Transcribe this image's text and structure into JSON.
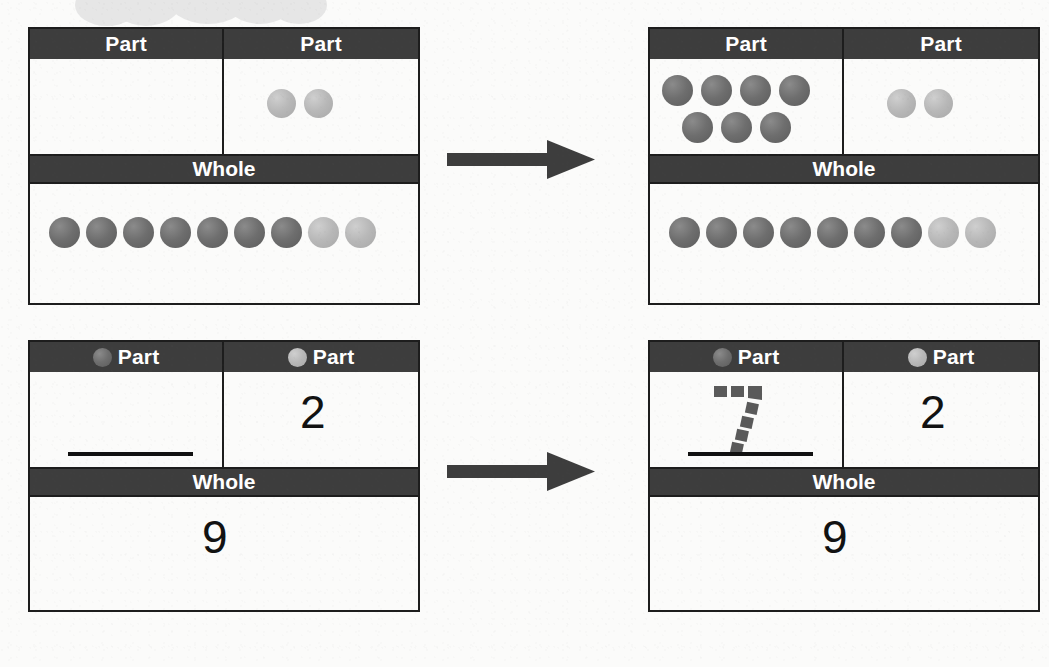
{
  "page": {
    "background_color": "#fbfbfa",
    "header_bar_color": "#3d3d3d",
    "border_color": "#1d1d1d",
    "dark_counter_color": "#6e6e6e",
    "light_counter_color": "#b8b8b8"
  },
  "labels": {
    "part": "Part",
    "whole": "Whole"
  },
  "decor": {
    "top_cloud": "cloud-shape",
    "arrow_top": "right-arrow-icon",
    "arrow_bottom": "right-arrow-icon"
  },
  "tables": [
    {
      "id": "top-left",
      "position": "top-left",
      "header_left": {
        "label": "Part",
        "dot": null
      },
      "header_right": {
        "label": "Part",
        "dot": null
      },
      "header_whole": "Whole",
      "part_left": {
        "type": "counters",
        "dark_count": 0,
        "light_count": 0,
        "rows": []
      },
      "part_right": {
        "type": "counters",
        "dark_count": 0,
        "light_count": 2,
        "rows": [
          [
            "light",
            "light"
          ]
        ]
      },
      "whole": {
        "type": "counters",
        "dark_count": 7,
        "light_count": 2,
        "total": 9,
        "rows": [
          [
            "dark",
            "dark",
            "dark",
            "dark",
            "dark",
            "dark",
            "dark",
            "light",
            "light"
          ]
        ]
      }
    },
    {
      "id": "top-right",
      "position": "top-right",
      "header_left": {
        "label": "Part",
        "dot": null
      },
      "header_right": {
        "label": "Part",
        "dot": null
      },
      "header_whole": "Whole",
      "part_left": {
        "type": "counters",
        "dark_count": 7,
        "light_count": 0,
        "rows": [
          [
            "dark",
            "dark",
            "dark",
            "dark"
          ],
          [
            "dark",
            "dark",
            "dark"
          ]
        ]
      },
      "part_right": {
        "type": "counters",
        "dark_count": 0,
        "light_count": 2,
        "rows": [
          [
            "light",
            "light"
          ]
        ]
      },
      "whole": {
        "type": "counters",
        "dark_count": 7,
        "light_count": 2,
        "total": 9,
        "rows": [
          [
            "dark",
            "dark",
            "dark",
            "dark",
            "dark",
            "dark",
            "dark",
            "light",
            "light"
          ]
        ]
      }
    },
    {
      "id": "bottom-left",
      "position": "bottom-left",
      "header_left": {
        "label": "Part",
        "dot": "dark"
      },
      "header_right": {
        "label": "Part",
        "dot": "light"
      },
      "header_whole": "Whole",
      "part_left": {
        "type": "blank",
        "value": "",
        "has_answer_line": true
      },
      "part_right": {
        "type": "numeral",
        "value": "2"
      },
      "whole": {
        "type": "numeral",
        "value": "9"
      }
    },
    {
      "id": "bottom-right",
      "position": "bottom-right",
      "header_left": {
        "label": "Part",
        "dot": "dark"
      },
      "header_right": {
        "label": "Part",
        "dot": "light"
      },
      "header_whole": "Whole",
      "part_left": {
        "type": "traced",
        "value": "7",
        "trace_style": "dashed",
        "has_answer_line": true
      },
      "part_right": {
        "type": "numeral",
        "value": "2"
      },
      "whole": {
        "type": "numeral",
        "value": "9"
      }
    }
  ]
}
